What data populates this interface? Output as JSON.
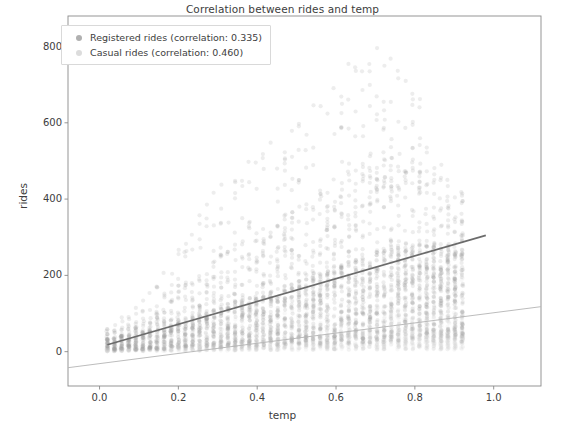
{
  "chart_data": {
    "type": "scatter",
    "title": "Correlation between rides and temp",
    "xlabel": "temp",
    "ylabel": "rides",
    "xlim": [
      -0.08,
      1.12
    ],
    "ylim": [
      -90,
      880
    ],
    "grid": false,
    "legend_position": "upper left",
    "xticks": [
      "0.0",
      "0.2",
      "0.4",
      "0.6",
      "0.8",
      "1.0"
    ],
    "xtick_values": [
      0.0,
      0.2,
      0.4,
      0.6,
      0.8,
      1.0
    ],
    "yticks": [
      "0",
      "200",
      "400",
      "600",
      "800"
    ],
    "ytick_values": [
      0,
      200,
      400,
      600,
      800
    ],
    "series": [
      {
        "name": "Registered rides (correlation: 0.335)",
        "short_name": "registered",
        "correlation": 0.335,
        "color": "#9a9a9a",
        "marker": "circle",
        "alpha": 0.18,
        "trendline": {
          "color": "#6b6b6b",
          "x0": 0.02,
          "y0": 18,
          "x1": 0.98,
          "y1": 305
        }
      },
      {
        "name": "Casual rides (correlation: 0.460)",
        "short_name": "casual",
        "correlation": 0.46,
        "color": "#cfcfcf",
        "marker": "circle",
        "alpha": 0.14,
        "trendline": {
          "color": "#b4b4b4",
          "x0": -0.08,
          "y0": -42,
          "x1": 1.12,
          "y1": 118
        }
      }
    ],
    "registered_column_stats": [
      {
        "temp": 0.02,
        "median": 20,
        "p90": 45,
        "p10": 4,
        "max": 70
      },
      {
        "temp": 0.06,
        "median": 26,
        "p90": 60,
        "p10": 5,
        "max": 95
      },
      {
        "temp": 0.1,
        "median": 30,
        "p90": 75,
        "p10": 5,
        "max": 130
      },
      {
        "temp": 0.14,
        "median": 36,
        "p90": 95,
        "p10": 6,
        "max": 180
      },
      {
        "temp": 0.18,
        "median": 45,
        "p90": 130,
        "p10": 6,
        "max": 250
      },
      {
        "temp": 0.22,
        "median": 55,
        "p90": 170,
        "p10": 7,
        "max": 320
      },
      {
        "temp": 0.26,
        "median": 62,
        "p90": 200,
        "p10": 7,
        "max": 380
      },
      {
        "temp": 0.3,
        "median": 70,
        "p90": 225,
        "p10": 8,
        "max": 430
      },
      {
        "temp": 0.34,
        "median": 80,
        "p90": 255,
        "p10": 8,
        "max": 470
      },
      {
        "temp": 0.38,
        "median": 88,
        "p90": 275,
        "p10": 8,
        "max": 500
      },
      {
        "temp": 0.42,
        "median": 95,
        "p90": 300,
        "p10": 9,
        "max": 540
      },
      {
        "temp": 0.46,
        "median": 102,
        "p90": 320,
        "p10": 9,
        "max": 570
      },
      {
        "temp": 0.5,
        "median": 112,
        "p90": 345,
        "p10": 10,
        "max": 610
      },
      {
        "temp": 0.54,
        "median": 120,
        "p90": 370,
        "p10": 10,
        "max": 650
      },
      {
        "temp": 0.58,
        "median": 130,
        "p90": 400,
        "p10": 11,
        "max": 700
      },
      {
        "temp": 0.62,
        "median": 140,
        "p90": 430,
        "p10": 11,
        "max": 760
      },
      {
        "temp": 0.66,
        "median": 150,
        "p90": 460,
        "p10": 12,
        "max": 800
      },
      {
        "temp": 0.7,
        "median": 160,
        "p90": 480,
        "p10": 12,
        "max": 820
      },
      {
        "temp": 0.74,
        "median": 168,
        "p90": 490,
        "p10": 12,
        "max": 800
      },
      {
        "temp": 0.78,
        "median": 172,
        "p90": 480,
        "p10": 12,
        "max": 760
      },
      {
        "temp": 0.82,
        "median": 175,
        "p90": 450,
        "p10": 12,
        "max": 640
      },
      {
        "temp": 0.86,
        "median": 170,
        "p90": 400,
        "p10": 11,
        "max": 540
      },
      {
        "temp": 0.9,
        "median": 160,
        "p90": 330,
        "p10": 10,
        "max": 420
      }
    ],
    "casual_column_stats": [
      {
        "temp": 0.02,
        "median": 4,
        "p90": 12,
        "max": 25
      },
      {
        "temp": 0.1,
        "median": 6,
        "p90": 20,
        "max": 45
      },
      {
        "temp": 0.18,
        "median": 9,
        "p90": 32,
        "max": 70
      },
      {
        "temp": 0.26,
        "median": 13,
        "p90": 45,
        "max": 100
      },
      {
        "temp": 0.34,
        "median": 17,
        "p90": 58,
        "max": 130
      },
      {
        "temp": 0.42,
        "median": 21,
        "p90": 70,
        "max": 155
      },
      {
        "temp": 0.5,
        "median": 25,
        "p90": 82,
        "max": 180
      },
      {
        "temp": 0.58,
        "median": 29,
        "p90": 95,
        "max": 205
      },
      {
        "temp": 0.66,
        "median": 33,
        "p90": 105,
        "max": 230
      },
      {
        "temp": 0.74,
        "median": 36,
        "p90": 112,
        "max": 245
      },
      {
        "temp": 0.82,
        "median": 37,
        "p90": 110,
        "max": 240
      },
      {
        "temp": 0.9,
        "median": 34,
        "p90": 95,
        "max": 200
      }
    ]
  },
  "legend": {
    "items": [
      {
        "label": "Registered rides (correlation: 0.335)",
        "color": "#b0b0b0"
      },
      {
        "label": "Casual rides (correlation: 0.460)",
        "color": "#dcdcdc"
      }
    ]
  },
  "colors": {
    "background": "#ffffff",
    "axis": "#8a8a8a",
    "text": "#3d3d3d",
    "registered_points": "#9a9a9a",
    "casual_points": "#cfcfcf",
    "registered_line": "#6b6b6b",
    "casual_line": "#b4b4b4"
  }
}
